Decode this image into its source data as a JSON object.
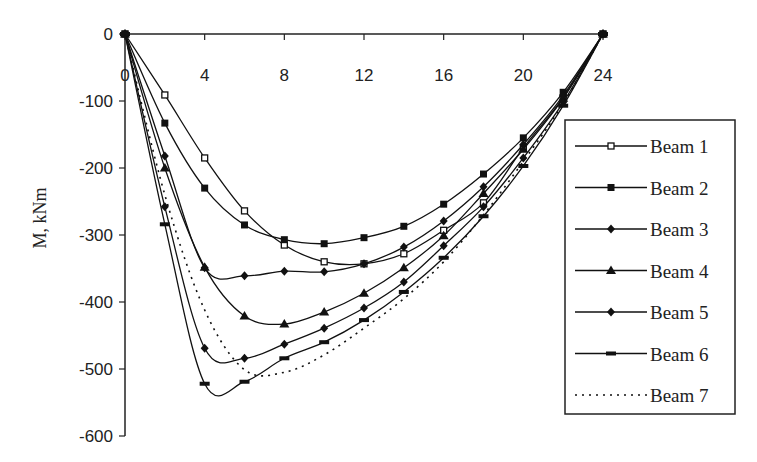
{
  "chart_data": {
    "type": "line",
    "title": "",
    "xlabel": "",
    "ylabel": "M, kNm",
    "xlim": [
      0,
      24
    ],
    "ylim": [
      -600,
      0
    ],
    "x_ticks": [
      0,
      4,
      8,
      12,
      16,
      20,
      24
    ],
    "y_ticks": [
      0,
      -100,
      -200,
      -300,
      -400,
      -500,
      -600
    ],
    "grid": false,
    "legend_position": "right",
    "x": [
      0,
      2,
      4,
      6,
      8,
      10,
      12,
      14,
      16,
      18,
      20,
      22,
      24
    ],
    "series": [
      {
        "name": "Beam 1",
        "marker": "open-square",
        "style": "solid",
        "values": [
          0,
          -91,
          -185,
          -264,
          -315,
          -340,
          -343,
          -328,
          -293,
          -252,
          -170,
          -95,
          0
        ]
      },
      {
        "name": "Beam 2",
        "marker": "filled-square",
        "style": "solid",
        "values": [
          0,
          -133,
          -230,
          -285,
          -307,
          -313,
          -304,
          -287,
          -254,
          -209,
          -155,
          -87,
          0
        ]
      },
      {
        "name": "Beam 3",
        "marker": "diamond",
        "style": "solid",
        "values": [
          0,
          -182,
          -349,
          -361,
          -354,
          -355,
          -343,
          -318,
          -279,
          -228,
          -165,
          -92,
          0
        ]
      },
      {
        "name": "Beam 4",
        "marker": "triangle",
        "style": "solid",
        "values": [
          0,
          -200,
          -348,
          -421,
          -433,
          -415,
          -387,
          -349,
          -301,
          -238,
          -172,
          -96,
          0
        ]
      },
      {
        "name": "Beam 5",
        "marker": "diamond",
        "style": "solid",
        "values": [
          0,
          -258,
          -469,
          -484,
          -463,
          -439,
          -409,
          -370,
          -316,
          -258,
          -185,
          -102,
          0
        ]
      },
      {
        "name": "Beam 6",
        "marker": "dash",
        "style": "solid",
        "values": [
          0,
          -284,
          -522,
          -519,
          -484,
          -460,
          -427,
          -385,
          -334,
          -272,
          -197,
          -107,
          0
        ]
      },
      {
        "name": "Beam 7",
        "marker": "none",
        "style": "dotted",
        "values": [
          0,
          -240,
          -412,
          -501,
          -505,
          -479,
          -439,
          -395,
          -340,
          -270,
          -190,
          -104,
          0
        ]
      }
    ]
  }
}
